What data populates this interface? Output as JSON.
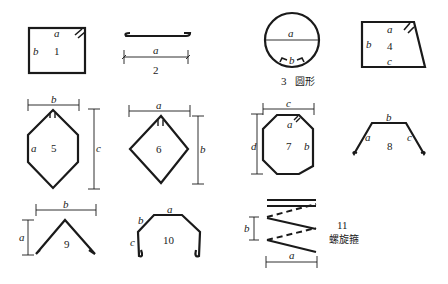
{
  "figure": {
    "shapes": [
      {
        "id": 1,
        "number": "1",
        "name": "closed-rectangular-stirrup",
        "labels": {
          "a": "a",
          "b": "b"
        }
      },
      {
        "id": 2,
        "number": "2",
        "name": "straight-bar-with-hooks",
        "labels": {
          "a": "a"
        }
      },
      {
        "id": 3,
        "number": "3",
        "caption": "圆形",
        "name": "circular-stirrup",
        "labels": {
          "a": "a",
          "b": "b"
        }
      },
      {
        "id": 4,
        "number": "4",
        "name": "trapezoid-stirrup",
        "labels": {
          "a": "a",
          "b": "b",
          "c": "c"
        }
      },
      {
        "id": 5,
        "number": "5",
        "name": "hexagonal-stirrup",
        "labels": {
          "a": "a",
          "b": "b",
          "c": "c"
        }
      },
      {
        "id": 6,
        "number": "6",
        "name": "diamond-stirrup",
        "labels": {
          "a": "a",
          "b": "b"
        }
      },
      {
        "id": 7,
        "number": "7",
        "name": "octagonal-stirrup",
        "labels": {
          "a": "a",
          "b": "b",
          "c": "c",
          "d": "d"
        }
      },
      {
        "id": 8,
        "number": "8",
        "name": "open-trapezoid-bar",
        "labels": {
          "a": "a",
          "b": "b",
          "c": "c"
        }
      },
      {
        "id": 9,
        "number": "9",
        "name": "v-shaped-bar",
        "labels": {
          "a": "a",
          "b": "b"
        }
      },
      {
        "id": 10,
        "number": "10",
        "name": "open-u-bar-with-chamfers",
        "labels": {
          "a": "a",
          "b": "b",
          "c": "c"
        }
      },
      {
        "id": 11,
        "number": "11",
        "caption": "螺旋箍",
        "name": "spiral-stirrup",
        "labels": {
          "a": "a",
          "b": "b"
        }
      }
    ]
  }
}
